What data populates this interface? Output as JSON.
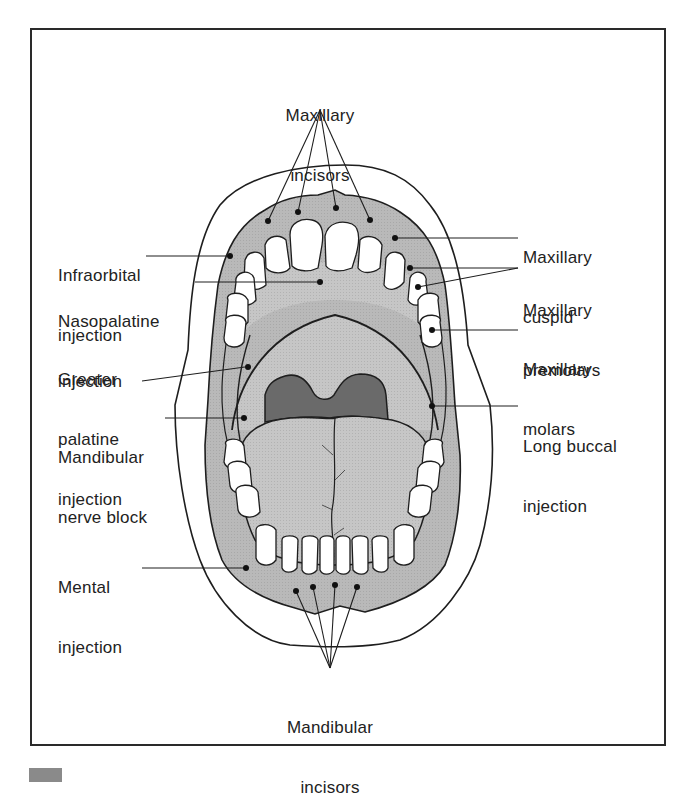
{
  "figure": {
    "colors": {
      "gum_fill": "#b8b8b8",
      "palate_fill": "#c4c4c4",
      "throat_fill": "#6a6a6a",
      "tongue_fill": "#bdbdbd",
      "outline": "#1e1e1e",
      "teeth": "#ffffff"
    },
    "labels": {
      "maxillary_incisors": {
        "line1": "Maxillary",
        "line2": "incisors"
      },
      "infraorbital_injection": {
        "line1": "Infraorbital",
        "line2": "injection"
      },
      "nasopalatine_injection": {
        "line1": "Nasopalatine",
        "line2": "injection"
      },
      "greater_palatine_injection": {
        "line1": "Greater",
        "line2": "palatine",
        "line3": "injection"
      },
      "mandibular_nerve_block": {
        "line1": "Mandibular",
        "line2": "nerve block"
      },
      "mental_injection": {
        "line1": "Mental",
        "line2": "injection"
      },
      "maxillary_cuspid": {
        "line1": "Maxillary",
        "line2": "cuspid"
      },
      "maxillary_premolars": {
        "line1": "Maxillary",
        "line2": "premolars"
      },
      "maxillary_molars": {
        "line1": "Maxillary",
        "line2": "molars"
      },
      "long_buccal_injection": {
        "line1": "Long buccal",
        "line2": "injection"
      },
      "mandibular_incisors": {
        "line1": "Mandibular",
        "line2": "incisors"
      }
    }
  }
}
